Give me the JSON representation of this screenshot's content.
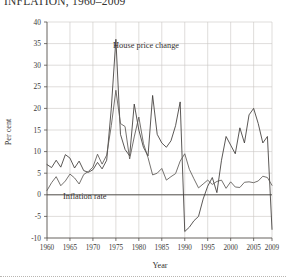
{
  "figure": {
    "title": "INFLATION, 1960–2009"
  },
  "chart_data": {
    "type": "line",
    "title": "INFLATION, 1960–2009",
    "xlabel": "Year",
    "ylabel": "Per cent",
    "xlim": [
      1960,
      2009
    ],
    "ylim": [
      -10,
      40
    ],
    "grid": true,
    "legend_position": "inline-annotation",
    "x_ticks": [
      1960,
      1965,
      1970,
      1975,
      1980,
      1985,
      1990,
      1995,
      2000,
      2005,
      2009
    ],
    "y_ticks": [
      -10,
      -5,
      0,
      5,
      10,
      15,
      20,
      25,
      30,
      35,
      40
    ],
    "x": [
      1960,
      1961,
      1962,
      1963,
      1964,
      1965,
      1966,
      1967,
      1968,
      1969,
      1970,
      1971,
      1972,
      1973,
      1974,
      1975,
      1976,
      1977,
      1978,
      1979,
      1980,
      1981,
      1982,
      1983,
      1984,
      1985,
      1986,
      1987,
      1988,
      1989,
      1990,
      1991,
      1992,
      1993,
      1994,
      1995,
      1996,
      1997,
      1998,
      1999,
      2000,
      2001,
      2002,
      2003,
      2004,
      2005,
      2006,
      2007,
      2008,
      2009
    ],
    "series": [
      {
        "name": "House price change",
        "color": "#3d3a37",
        "annotation": "House price change",
        "values": [
          7.0,
          6.3,
          8.0,
          6.4,
          9.3,
          8.5,
          6.2,
          7.8,
          5.6,
          5.2,
          5.8,
          7.5,
          6.0,
          8.0,
          20.0,
          36.0,
          14.0,
          10.5,
          9.0,
          21.0,
          15.0,
          11.0,
          9.0,
          23.0,
          14.0,
          12.0,
          11.0,
          12.5,
          16.0,
          21.5,
          -8.5,
          -7.5,
          -6.0,
          -5.0,
          -1.0,
          2.0,
          4.0,
          0.5,
          8.0,
          13.5,
          11.5,
          9.5,
          15.5,
          12.0,
          18.5,
          20.0,
          16.5,
          12.0,
          13.5,
          -8.0
        ]
      },
      {
        "name": "Inflation rate",
        "color": "#5c5855",
        "annotation": "Inflation rate",
        "values": [
          1.0,
          2.8,
          4.2,
          2.1,
          3.2,
          4.8,
          3.9,
          2.5,
          4.7,
          5.4,
          6.4,
          9.4,
          7.1,
          9.2,
          16.0,
          24.2,
          16.5,
          15.8,
          8.3,
          13.4,
          18.0,
          11.9,
          8.6,
          4.6,
          5.0,
          6.1,
          3.4,
          4.2,
          4.9,
          7.8,
          9.5,
          5.9,
          3.7,
          1.6,
          2.5,
          3.4,
          2.4,
          3.1,
          3.4,
          1.5,
          3.0,
          1.8,
          1.7,
          2.9,
          3.0,
          2.8,
          3.2,
          4.3,
          4.0,
          2.2
        ]
      }
    ]
  }
}
